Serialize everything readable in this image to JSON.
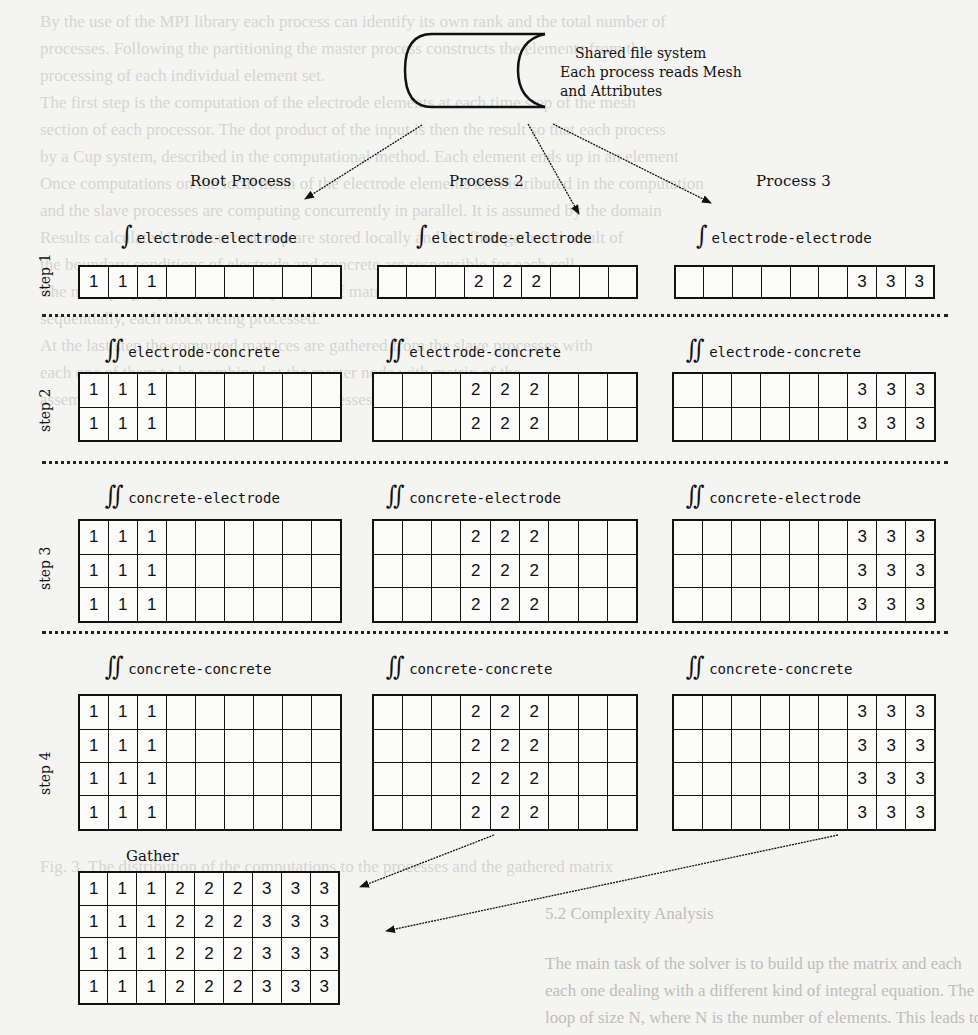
{
  "file_system": {
    "line1": "Shared file system",
    "line2": "Each process reads Mesh",
    "line3": "and Attributes"
  },
  "processes": [
    {
      "label": "Root Process",
      "value": "1",
      "active_cols": [
        0,
        1,
        2
      ]
    },
    {
      "label": "Process 2",
      "value": "2",
      "active_cols": [
        3,
        4,
        5
      ]
    },
    {
      "label": "Process 3",
      "value": "3",
      "active_cols": [
        6,
        7,
        8
      ]
    }
  ],
  "grid_columns": 9,
  "steps": [
    {
      "label": "step 1",
      "integral": "∫",
      "term": "electrode-electrode",
      "rows": 1
    },
    {
      "label": "step 2",
      "integral": "∬",
      "term": "electrode-concrete",
      "rows": 2
    },
    {
      "label": "step 3",
      "integral": "∬",
      "term": "concrete-electrode",
      "rows": 3
    },
    {
      "label": "step 4",
      "integral": "∬",
      "term": "concrete-concrete",
      "rows": 4
    }
  ],
  "step_cells": {
    "step1": {
      "root": [
        [
          "1",
          "1",
          "1",
          "",
          "",
          "",
          "",
          "",
          ""
        ]
      ],
      "p2": [
        [
          "",
          "",
          "",
          "2",
          "2",
          "2",
          "",
          "",
          ""
        ]
      ],
      "p3": [
        [
          "",
          "",
          "",
          "",
          "",
          "",
          "3",
          "3",
          "3"
        ]
      ]
    },
    "step2": {
      "root": [
        [
          "1",
          "1",
          "1",
          "",
          "",
          "",
          "",
          "",
          ""
        ],
        [
          "1",
          "1",
          "1",
          "",
          "",
          "",
          "",
          "",
          ""
        ]
      ],
      "p2": [
        [
          "",
          "",
          "",
          "2",
          "2",
          "2",
          "",
          "",
          ""
        ],
        [
          "",
          "",
          "",
          "2",
          "2",
          "2",
          "",
          "",
          ""
        ]
      ],
      "p3": [
        [
          "",
          "",
          "",
          "",
          "",
          "",
          "3",
          "3",
          "3"
        ],
        [
          "",
          "",
          "",
          "",
          "",
          "",
          "3",
          "3",
          "3"
        ]
      ]
    },
    "step3": {
      "root": [
        [
          "1",
          "1",
          "1",
          "",
          "",
          "",
          "",
          "",
          ""
        ],
        [
          "1",
          "1",
          "1",
          "",
          "",
          "",
          "",
          "",
          ""
        ],
        [
          "1",
          "1",
          "1",
          "",
          "",
          "",
          "",
          "",
          ""
        ]
      ],
      "p2": [
        [
          "",
          "",
          "",
          "2",
          "2",
          "2",
          "",
          "",
          ""
        ],
        [
          "",
          "",
          "",
          "2",
          "2",
          "2",
          "",
          "",
          ""
        ],
        [
          "",
          "",
          "",
          "2",
          "2",
          "2",
          "",
          "",
          ""
        ]
      ],
      "p3": [
        [
          "",
          "",
          "",
          "",
          "",
          "",
          "3",
          "3",
          "3"
        ],
        [
          "",
          "",
          "",
          "",
          "",
          "",
          "3",
          "3",
          "3"
        ],
        [
          "",
          "",
          "",
          "",
          "",
          "",
          "3",
          "3",
          "3"
        ]
      ]
    },
    "step4": {
      "root": [
        [
          "1",
          "1",
          "1",
          "",
          "",
          "",
          "",
          "",
          ""
        ],
        [
          "1",
          "1",
          "1",
          "",
          "",
          "",
          "",
          "",
          ""
        ],
        [
          "1",
          "1",
          "1",
          "",
          "",
          "",
          "",
          "",
          ""
        ],
        [
          "1",
          "1",
          "1",
          "",
          "",
          "",
          "",
          "",
          ""
        ]
      ],
      "p2": [
        [
          "",
          "",
          "",
          "2",
          "2",
          "2",
          "",
          "",
          ""
        ],
        [
          "",
          "",
          "",
          "2",
          "2",
          "2",
          "",
          "",
          ""
        ],
        [
          "",
          "",
          "",
          "2",
          "2",
          "2",
          "",
          "",
          ""
        ],
        [
          "",
          "",
          "",
          "2",
          "2",
          "2",
          "",
          "",
          ""
        ]
      ],
      "p3": [
        [
          "",
          "",
          "",
          "",
          "",
          "",
          "3",
          "3",
          "3"
        ],
        [
          "",
          "",
          "",
          "",
          "",
          "",
          "3",
          "3",
          "3"
        ],
        [
          "",
          "",
          "",
          "",
          "",
          "",
          "3",
          "3",
          "3"
        ],
        [
          "",
          "",
          "",
          "",
          "",
          "",
          "3",
          "3",
          "3"
        ]
      ]
    }
  },
  "gather": {
    "label": "Gather",
    "cells": [
      [
        "1",
        "1",
        "1",
        "2",
        "2",
        "2",
        "3",
        "3",
        "3"
      ],
      [
        "1",
        "1",
        "1",
        "2",
        "2",
        "2",
        "3",
        "3",
        "3"
      ],
      [
        "1",
        "1",
        "1",
        "2",
        "2",
        "2",
        "3",
        "3",
        "3"
      ],
      [
        "1",
        "1",
        "1",
        "2",
        "2",
        "2",
        "3",
        "3",
        "3"
      ]
    ]
  },
  "colors": {
    "ink": "#111111",
    "paper": "#f4f4f2",
    "bleed_through": "#d4d4d0"
  }
}
